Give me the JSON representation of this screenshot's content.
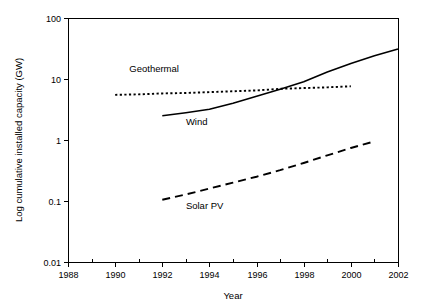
{
  "chart_data": {
    "type": "line",
    "title": "",
    "xlabel": "Year",
    "ylabel": "Log cumulative installed capacity (GW)",
    "yscale": "log",
    "xlim": [
      1988,
      2002
    ],
    "ylim": [
      0.01,
      100
    ],
    "grid": false,
    "legend_position": "inline-annotations",
    "x_ticks": [
      1988,
      1990,
      1992,
      1994,
      1996,
      1998,
      2000,
      2002
    ],
    "x_tick_labels": [
      "1988",
      "1990",
      "1992",
      "1994",
      "1996",
      "1998",
      "2000",
      "2002"
    ],
    "x_minor_ticks": [
      1989,
      1991,
      1993,
      1995,
      1997,
      1999,
      2001
    ],
    "y_ticks": [
      100,
      10,
      1,
      0.1,
      0.01
    ],
    "y_tick_labels": [
      "100",
      "10",
      "1",
      "0.1",
      "0.01"
    ],
    "series": [
      {
        "name": "Geothermal",
        "label": "Geothermal",
        "style": "dotted",
        "color": "#000000",
        "label_x": 1990.6,
        "label_y": 13.0,
        "x": [
          1990,
          1991,
          1992,
          1993,
          1994,
          1995,
          1996,
          1997,
          1998,
          1999,
          2000
        ],
        "values": [
          5.5,
          5.6,
          5.8,
          5.9,
          6.1,
          6.3,
          6.5,
          6.9,
          7.1,
          7.3,
          7.6
        ]
      },
      {
        "name": "Wind",
        "label": "Wind",
        "style": "solid",
        "color": "#000000",
        "label_x": 1993.0,
        "label_y": 1.78,
        "x": [
          1992,
          1993,
          1994,
          1995,
          1996,
          1997,
          1998,
          1999,
          2000,
          2001,
          2002
        ],
        "values": [
          2.5,
          2.8,
          3.2,
          4.0,
          5.2,
          6.8,
          9.0,
          13.0,
          18.0,
          24.0,
          31.0
        ]
      },
      {
        "name": "Solar PV",
        "label": "Solar PV",
        "style": "dashed",
        "color": "#000000",
        "label_x": 1993.0,
        "label_y": 0.074,
        "x": [
          1992,
          1993,
          1994,
          1995,
          1996,
          1997,
          1998,
          1999,
          2000,
          2001
        ],
        "values": [
          0.105,
          0.128,
          0.16,
          0.2,
          0.25,
          0.32,
          0.42,
          0.56,
          0.74,
          0.95
        ]
      }
    ]
  }
}
